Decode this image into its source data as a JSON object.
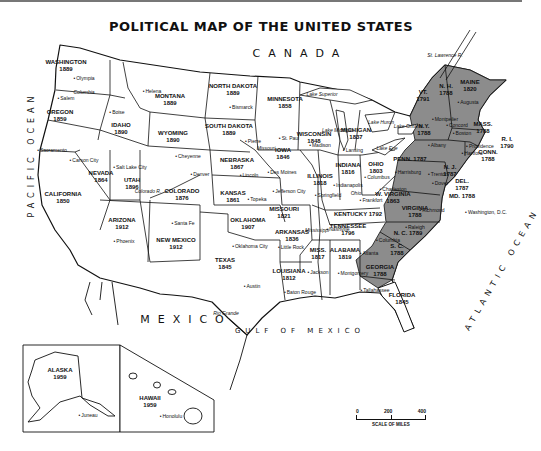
{
  "title": "POLITICAL MAP OF THE UNITED STATES",
  "regions": {
    "canada": "CANADA",
    "mexico": "MEXICO",
    "gulf": "GULF OF MEXICO",
    "pacific": "PACIFIC OCEAN",
    "atlantic": "ATLANTIC OCEAN"
  },
  "colors": {
    "original_states_fill": "#8c8c8c",
    "land_fill": "#ffffff",
    "border": "#111111"
  },
  "states": [
    {
      "name": "WASHINGTON",
      "year": "1889",
      "x": 66,
      "y": 66
    },
    {
      "name": "OREGON",
      "year": "1859",
      "x": 60,
      "y": 116
    },
    {
      "name": "IDAHO",
      "year": "1890",
      "x": 121,
      "y": 129
    },
    {
      "name": "MONTANA",
      "year": "1889",
      "x": 170,
      "y": 100
    },
    {
      "name": "WYOMING",
      "year": "1890",
      "x": 173,
      "y": 137
    },
    {
      "name": "NORTH DAKOTA",
      "year": "1889",
      "x": 233,
      "y": 90
    },
    {
      "name": "SOUTH DAKOTA",
      "year": "1889",
      "x": 229,
      "y": 130
    },
    {
      "name": "MINNESOTA",
      "year": "1858",
      "x": 285,
      "y": 103
    },
    {
      "name": "WISCONSIN",
      "year": "1848",
      "x": 314,
      "y": 138
    },
    {
      "name": "MICHIGAN",
      "year": "1837",
      "x": 356,
      "y": 134
    },
    {
      "name": "CALIFORNIA",
      "year": "1850",
      "x": 63,
      "y": 198
    },
    {
      "name": "NEVADA",
      "year": "1864",
      "x": 101,
      "y": 177
    },
    {
      "name": "UTAH",
      "year": "1896",
      "x": 132,
      "y": 184
    },
    {
      "name": "COLORADO",
      "year": "1876",
      "x": 182,
      "y": 195
    },
    {
      "name": "NEBRASKA",
      "year": "1867",
      "x": 237,
      "y": 164
    },
    {
      "name": "IOWA",
      "year": "1846",
      "x": 283,
      "y": 154
    },
    {
      "name": "ILLINOIS",
      "year": "1818",
      "x": 320,
      "y": 180
    },
    {
      "name": "INDIANA",
      "year": "1816",
      "x": 348,
      "y": 169
    },
    {
      "name": "OHIO",
      "year": "1803",
      "x": 376,
      "y": 168
    },
    {
      "name": "KANSAS",
      "year": "1861",
      "x": 233,
      "y": 197
    },
    {
      "name": "MISSOURI",
      "year": "1821",
      "x": 284,
      "y": 213
    },
    {
      "name": "ARIZONA",
      "year": "1912",
      "x": 122,
      "y": 224
    },
    {
      "name": "NEW MEXICO",
      "year": "1912",
      "x": 176,
      "y": 244
    },
    {
      "name": "OKLAHOMA",
      "year": "1907",
      "x": 248,
      "y": 224
    },
    {
      "name": "ARKANSAS",
      "year": "1836",
      "x": 292,
      "y": 236
    },
    {
      "name": "TEXAS",
      "year": "1845",
      "x": 225,
      "y": 264
    },
    {
      "name": "LOUISIANA",
      "year": "1812",
      "x": 289,
      "y": 275
    },
    {
      "name": "MISS.",
      "year": "1817",
      "x": 318,
      "y": 254
    },
    {
      "name": "ALABAMA",
      "year": "1819",
      "x": 345,
      "y": 254
    },
    {
      "name": "TENNESSEE",
      "year": "1796",
      "x": 348,
      "y": 230
    },
    {
      "name": "KENTUCKY 1792",
      "year": "",
      "x": 358,
      "y": 214
    },
    {
      "name": "FLORIDA",
      "year": "1845",
      "x": 402,
      "y": 299
    },
    {
      "name": "GEORGIA",
      "year": "1788",
      "x": 380,
      "y": 271
    },
    {
      "name": "S. C.",
      "year": "1788",
      "x": 397,
      "y": 250
    },
    {
      "name": "N. C. 1789",
      "year": "",
      "x": 408,
      "y": 233
    },
    {
      "name": "VIRGINIA",
      "year": "1788",
      "x": 415,
      "y": 212
    },
    {
      "name": "W. VIRGINIA",
      "year": "1863",
      "x": 393,
      "y": 198
    },
    {
      "name": "PENN. 1787",
      "year": "",
      "x": 410,
      "y": 159
    },
    {
      "name": "N.Y.",
      "year": "1788",
      "x": 424,
      "y": 130
    },
    {
      "name": "VT.",
      "year": "1791",
      "x": 423,
      "y": 96
    },
    {
      "name": "N. H.",
      "year": "1788",
      "x": 446,
      "y": 90
    },
    {
      "name": "MAINE",
      "year": "1820",
      "x": 470,
      "y": 86
    },
    {
      "name": "MASS.",
      "year": "1788",
      "x": 483,
      "y": 128
    },
    {
      "name": "R. I.",
      "year": "1790",
      "x": 507,
      "y": 143
    },
    {
      "name": "CONN.",
      "year": "1788",
      "x": 488,
      "y": 156
    },
    {
      "name": "N. J.",
      "year": "1787",
      "x": 450,
      "y": 171
    },
    {
      "name": "DEL.",
      "year": "1787",
      "x": 462,
      "y": 185
    },
    {
      "name": "MD. 1788",
      "year": "",
      "x": 462,
      "y": 196
    },
    {
      "name": "ALASKA",
      "year": "1959",
      "x": 60,
      "y": 374
    },
    {
      "name": "HAWAII",
      "year": "1959",
      "x": 150,
      "y": 402
    }
  ],
  "capitals": [
    {
      "name": "Olympia",
      "x": 84,
      "y": 78
    },
    {
      "name": "Salem",
      "x": 66,
      "y": 98
    },
    {
      "name": "Boise",
      "x": 117,
      "y": 112
    },
    {
      "name": "Helena",
      "x": 152,
      "y": 91
    },
    {
      "name": "Bismarck",
      "x": 241,
      "y": 107
    },
    {
      "name": "Pierre",
      "x": 253,
      "y": 141
    },
    {
      "name": "St. Paul",
      "x": 289,
      "y": 138
    },
    {
      "name": "Madison",
      "x": 320,
      "y": 145
    },
    {
      "name": "Lansing",
      "x": 353,
      "y": 150
    },
    {
      "name": "Sacramento",
      "x": 52,
      "y": 150
    },
    {
      "name": "Carson City",
      "x": 84,
      "y": 160
    },
    {
      "name": "Salt Lake City",
      "x": 130,
      "y": 167
    },
    {
      "name": "Cheyenne",
      "x": 188,
      "y": 156
    },
    {
      "name": "Denver",
      "x": 200,
      "y": 174
    },
    {
      "name": "Lincoln",
      "x": 249,
      "y": 175
    },
    {
      "name": "Des Moines",
      "x": 282,
      "y": 172
    },
    {
      "name": "Topeka",
      "x": 257,
      "y": 199
    },
    {
      "name": "Jefferson City",
      "x": 289,
      "y": 191
    },
    {
      "name": "Springfield",
      "x": 328,
      "y": 195
    },
    {
      "name": "Indianapolis",
      "x": 348,
      "y": 185
    },
    {
      "name": "Columbus",
      "x": 377,
      "y": 177
    },
    {
      "name": "Frankfort",
      "x": 371,
      "y": 200
    },
    {
      "name": "Charleston",
      "x": 393,
      "y": 189
    },
    {
      "name": "Harrisburg",
      "x": 408,
      "y": 172
    },
    {
      "name": "Trenton",
      "x": 438,
      "y": 174
    },
    {
      "name": "Dover",
      "x": 440,
      "y": 183
    },
    {
      "name": "Richmond",
      "x": 432,
      "y": 210
    },
    {
      "name": "Washington, D.C.",
      "x": 486,
      "y": 212
    },
    {
      "name": "Raleigh",
      "x": 415,
      "y": 227
    },
    {
      "name": "Nashville",
      "x": 338,
      "y": 229
    },
    {
      "name": "Little Rock",
      "x": 291,
      "y": 247
    },
    {
      "name": "Oklahoma City",
      "x": 250,
      "y": 246
    },
    {
      "name": "Santa Fe",
      "x": 183,
      "y": 223
    },
    {
      "name": "Phoenix",
      "x": 124,
      "y": 241
    },
    {
      "name": "Austin",
      "x": 252,
      "y": 286
    },
    {
      "name": "Jackson",
      "x": 318,
      "y": 272
    },
    {
      "name": "Montgomery",
      "x": 353,
      "y": 273
    },
    {
      "name": "Atlanta",
      "x": 369,
      "y": 253
    },
    {
      "name": "Columbia",
      "x": 388,
      "y": 240
    },
    {
      "name": "Baton Rouge",
      "x": 300,
      "y": 292
    },
    {
      "name": "Tallahassee",
      "x": 375,
      "y": 290
    },
    {
      "name": "Albany",
      "x": 437,
      "y": 145
    },
    {
      "name": "Montpelier",
      "x": 445,
      "y": 119
    },
    {
      "name": "Augusta",
      "x": 468,
      "y": 102
    },
    {
      "name": "Concord",
      "x": 457,
      "y": 125
    },
    {
      "name": "Boston",
      "x": 462,
      "y": 133
    },
    {
      "name": "Providence",
      "x": 480,
      "y": 146
    },
    {
      "name": "Hartford",
      "x": 472,
      "y": 153
    },
    {
      "name": "Juneau",
      "x": 88,
      "y": 415
    },
    {
      "name": "Honolulu",
      "x": 171,
      "y": 416
    }
  ],
  "water": [
    {
      "name": "Lake Superior",
      "x": 322,
      "y": 94
    },
    {
      "name": "Lake Huron",
      "x": 381,
      "y": 122
    },
    {
      "name": "Lake Michigan",
      "x": 338,
      "y": 130
    },
    {
      "name": "Lake Erie",
      "x": 387,
      "y": 148
    },
    {
      "name": "Lake Ontario",
      "x": 408,
      "y": 126
    },
    {
      "name": "Columbia",
      "x": 84,
      "y": 92
    },
    {
      "name": "Colorado R.",
      "x": 148,
      "y": 191
    },
    {
      "name": "Missouri",
      "x": 266,
      "y": 148
    },
    {
      "name": "Mississippi",
      "x": 317,
      "y": 230
    },
    {
      "name": "Ohio",
      "x": 356,
      "y": 193
    },
    {
      "name": "Rio Grande",
      "x": 226,
      "y": 313
    },
    {
      "name": "St. Lawrence R.",
      "x": 445,
      "y": 55
    }
  ],
  "scale": {
    "ticks": [
      "0",
      "200",
      "400"
    ],
    "label": "SCALE OF MILES"
  }
}
